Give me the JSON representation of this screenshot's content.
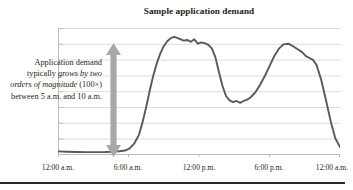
{
  "chart_data": {
    "type": "line",
    "title": "Sample application demand",
    "xlabel": "",
    "ylabel": "",
    "grid": true,
    "gridlines": 8,
    "legend": "none",
    "xlim": [
      0,
      24
    ],
    "ylim": [
      0,
      100
    ],
    "xtick_labels": [
      "12:00 a.m.",
      "6:00 a.m.",
      "12:00 p.m.",
      "6:00 p.m.",
      "12:00 a.m."
    ],
    "xtick_hours": [
      0,
      6,
      12,
      18,
      24
    ],
    "series": [
      {
        "name": "Application demand",
        "color": "#595959",
        "x": [
          0.0,
          0.8,
          1.6,
          2.4,
          3.2,
          4.0,
          4.6,
          5.2,
          5.7,
          6.1,
          6.5,
          6.9,
          7.2,
          7.5,
          7.8,
          8.1,
          8.4,
          8.7,
          9.0,
          9.3,
          9.6,
          9.9,
          10.3,
          10.7,
          11.0,
          11.3,
          11.6,
          11.9,
          12.2,
          12.5,
          12.8,
          13.1,
          13.4,
          13.7,
          14.0,
          14.3,
          14.6,
          14.9,
          15.2,
          15.5,
          15.8,
          16.1,
          16.4,
          16.8,
          17.2,
          17.6,
          18.0,
          18.4,
          18.8,
          19.2,
          19.6,
          20.0,
          20.4,
          20.8,
          21.1,
          21.4,
          21.7,
          22.0,
          22.4,
          22.8,
          23.2,
          23.6,
          24.0
        ],
        "y": [
          2.5,
          2.2,
          2.0,
          1.9,
          1.9,
          2.0,
          2.2,
          2.6,
          3.2,
          5.0,
          9.0,
          16.0,
          26.0,
          38.0,
          51.0,
          63.0,
          73.0,
          81.0,
          87.0,
          91.0,
          93.5,
          94.5,
          93.0,
          91.5,
          92.0,
          90.5,
          92.5,
          89.0,
          90.0,
          89.5,
          88.0,
          85.0,
          78.0,
          66.0,
          55.0,
          47.0,
          43.5,
          42.0,
          43.0,
          41.5,
          43.0,
          44.0,
          46.0,
          50.0,
          56.0,
          63.0,
          71.0,
          79.0,
          85.0,
          88.5,
          89.0,
          87.0,
          84.5,
          82.0,
          79.0,
          77.5,
          76.0,
          72.0,
          60.0,
          44.0,
          27.0,
          13.0,
          6.0
        ]
      }
    ],
    "annotations": [
      {
        "name": "demand-growth-note",
        "text_runs": [
          {
            "text": "Application demand typically ",
            "style": "normal"
          },
          {
            "text": "grows by two orders of magnitude",
            "style": "italic"
          },
          {
            "text": " (100×) between 5 a.m. and 10 a.m.",
            "style": "normal"
          }
        ],
        "arrow": {
          "name": "vertical-double-arrow",
          "color": "#a8a8a8",
          "direction": "double",
          "spans_hours": [
            5,
            10
          ]
        }
      }
    ]
  },
  "chart": {
    "title": "Sample application demand",
    "line_color": "#595959",
    "grid_color": "#d9d9d9",
    "axis_color": "#bfbfbf",
    "arrow_color": "#a8a8a8",
    "rule_color": "#2b2b2b"
  },
  "annotation": {
    "line1_a": "Application demand",
    "line2_a": "typically ",
    "line2_b": "grows by",
    "line3_b": "two orders of",
    "line4_b": "magnitude",
    "line4_a": " (100×)",
    "line5_a": "between 5 a.m. and",
    "line6_a": "10 a.m."
  },
  "xaxis": {
    "ticks": [
      {
        "label": "12:00 a.m."
      },
      {
        "label": "6:00 a.m."
      },
      {
        "label": "12:00 p.m."
      },
      {
        "label": "6:00 p.m."
      },
      {
        "label": "12:00 a.m."
      }
    ]
  }
}
